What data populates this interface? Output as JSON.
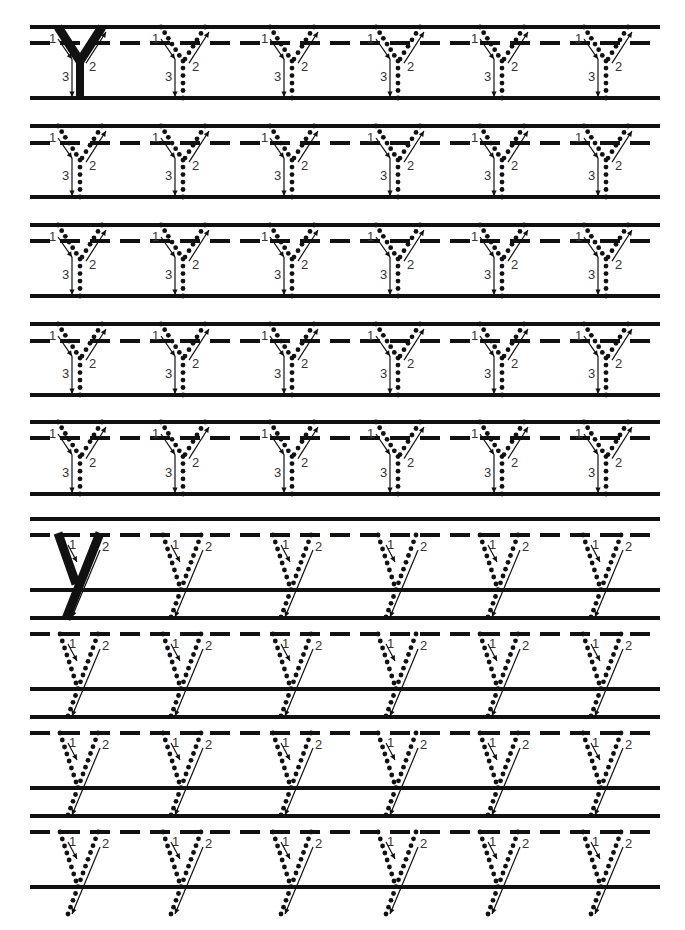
{
  "worksheet": {
    "title": "Letter Y tracing practice",
    "colors": {
      "ink": "#111111",
      "paper": "#ffffff",
      "label": "#333333"
    },
    "line_extent": {
      "x_start": 30,
      "x_end": 660
    },
    "uppercase": {
      "letter": "Y",
      "stroke_labels": [
        "1",
        "2",
        "3"
      ],
      "columns_x": [
        80,
        183,
        292,
        398,
        502,
        606
      ],
      "rows": [
        {
          "top": 27,
          "mid": 43,
          "base": 98
        },
        {
          "top": 126,
          "mid": 143,
          "base": 197
        },
        {
          "top": 225,
          "mid": 241,
          "base": 296
        },
        {
          "top": 324,
          "mid": 341,
          "base": 395
        },
        {
          "top": 422,
          "mid": 438,
          "base": 494
        }
      ],
      "model_cell": {
        "row": 0,
        "col": 0,
        "style": "solid"
      },
      "other_cells_style": "dotted"
    },
    "lowercase": {
      "letter": "y",
      "stroke_labels": [
        "1",
        "2"
      ],
      "columns_x": [
        80,
        183,
        293,
        398,
        500,
        603
      ],
      "rows": [
        {
          "top": 519,
          "mid": 535,
          "base": 590,
          "desc": 618
        },
        {
          "top": 618,
          "mid": 634,
          "base": 689,
          "desc": 717
        },
        {
          "top": 717,
          "mid": 733,
          "base": 788,
          "desc": 816
        },
        {
          "top": 816,
          "mid": 832,
          "base": 887,
          "desc": null
        }
      ],
      "model_cell": {
        "row": 0,
        "col": 0,
        "style": "solid"
      },
      "other_cells_style": "dotted"
    }
  }
}
